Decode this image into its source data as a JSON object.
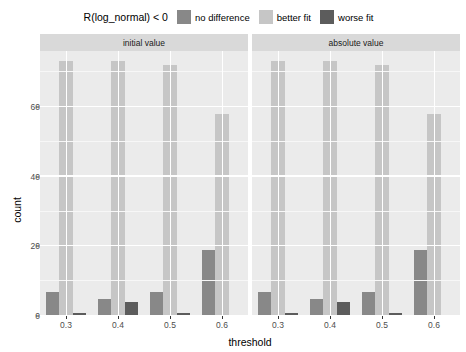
{
  "legend": {
    "title": "R(log_normal) < 0",
    "entries": [
      {
        "label": "no difference",
        "color": "#888888"
      },
      {
        "label": "better fit",
        "color": "#c6c6c6"
      },
      {
        "label": "worse fit",
        "color": "#5c5c5c"
      }
    ]
  },
  "axes": {
    "ylabel": "count",
    "xlabel": "threshold",
    "yticks": [
      "0",
      "20",
      "40",
      "60"
    ],
    "xticks": [
      "0.3",
      "0.4",
      "0.5",
      "0.6"
    ]
  },
  "panels": [
    {
      "title": "initial value"
    },
    {
      "title": "absolute value"
    }
  ],
  "chart_data": {
    "type": "bar",
    "title": "",
    "subtitle": "",
    "xlabel": "threshold",
    "ylabel": "count",
    "ylim": [
      0,
      76
    ],
    "yticks": [
      0,
      20,
      40,
      60
    ],
    "categories": [
      "0.3",
      "0.4",
      "0.5",
      "0.6"
    ],
    "grid": true,
    "legend_title": "R(log_normal) < 0",
    "legend_position": "top",
    "facet_variable": "value type",
    "facets": [
      {
        "name": "initial value",
        "series": [
          {
            "name": "no difference",
            "color": "#888888",
            "values": [
              7,
              5,
              7,
              19
            ]
          },
          {
            "name": "better fit",
            "color": "#c6c6c6",
            "values": [
              73,
              73,
              72,
              58
            ]
          },
          {
            "name": "worse fit",
            "color": "#5c5c5c",
            "values": [
              1,
              4,
              1,
              0
            ]
          }
        ]
      },
      {
        "name": "absolute value",
        "series": [
          {
            "name": "no difference",
            "color": "#888888",
            "values": [
              7,
              5,
              7,
              19
            ]
          },
          {
            "name": "better fit",
            "color": "#c6c6c6",
            "values": [
              73,
              73,
              72,
              58
            ]
          },
          {
            "name": "worse fit",
            "color": "#5c5c5c",
            "values": [
              1,
              4,
              1,
              0
            ]
          }
        ]
      }
    ]
  },
  "style": {
    "panel_background": "#ebebeb",
    "strip_background": "#d9d9d9",
    "gridline_color": "#ffffff",
    "plot_background": "#ffffff"
  }
}
